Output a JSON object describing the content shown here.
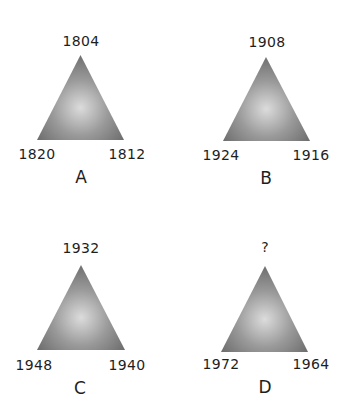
{
  "puzzle": {
    "panels": [
      {
        "letter": "A",
        "top": "1804",
        "left": "1820",
        "right": "1812",
        "apex": [
          80.5,
          55
        ],
        "base_left": [
          37,
          140
        ],
        "base_right": [
          124,
          140
        ],
        "top_label_pos": [
          81,
          41
        ],
        "left_label_pos": [
          37,
          154
        ],
        "right_label_pos": [
          127,
          154
        ],
        "letter_pos": [
          81,
          177
        ]
      },
      {
        "letter": "B",
        "top": "1908",
        "left": "1924",
        "right": "1916",
        "apex": [
          266,
          57
        ],
        "base_left": [
          223,
          141
        ],
        "base_right": [
          310,
          141
        ],
        "top_label_pos": [
          267,
          42
        ],
        "left_label_pos": [
          221,
          155
        ],
        "right_label_pos": [
          311,
          155
        ],
        "letter_pos": [
          266,
          178
        ]
      },
      {
        "letter": "C",
        "top": "1932",
        "left": "1948",
        "right": "1940",
        "apex": [
          81,
          265
        ],
        "base_left": [
          37,
          350
        ],
        "base_right": [
          125,
          350
        ],
        "top_label_pos": [
          81,
          248
        ],
        "left_label_pos": [
          34,
          365
        ],
        "right_label_pos": [
          127,
          365
        ],
        "letter_pos": [
          80,
          388
        ]
      },
      {
        "letter": "D",
        "top": "?",
        "left": "1972",
        "right": "1964",
        "apex": [
          265,
          266
        ],
        "base_left": [
          221,
          352
        ],
        "base_right": [
          308,
          352
        ],
        "top_label_pos": [
          265,
          247
        ],
        "left_label_pos": [
          221,
          364
        ],
        "right_label_pos": [
          311,
          364
        ],
        "letter_pos": [
          265,
          387
        ]
      }
    ],
    "colors": {
      "gradient_center": "#dcdcdc",
      "gradient_mid": "#9a9a9a",
      "gradient_edge": "#5e5e5e",
      "text": "#1e1e1e"
    }
  }
}
